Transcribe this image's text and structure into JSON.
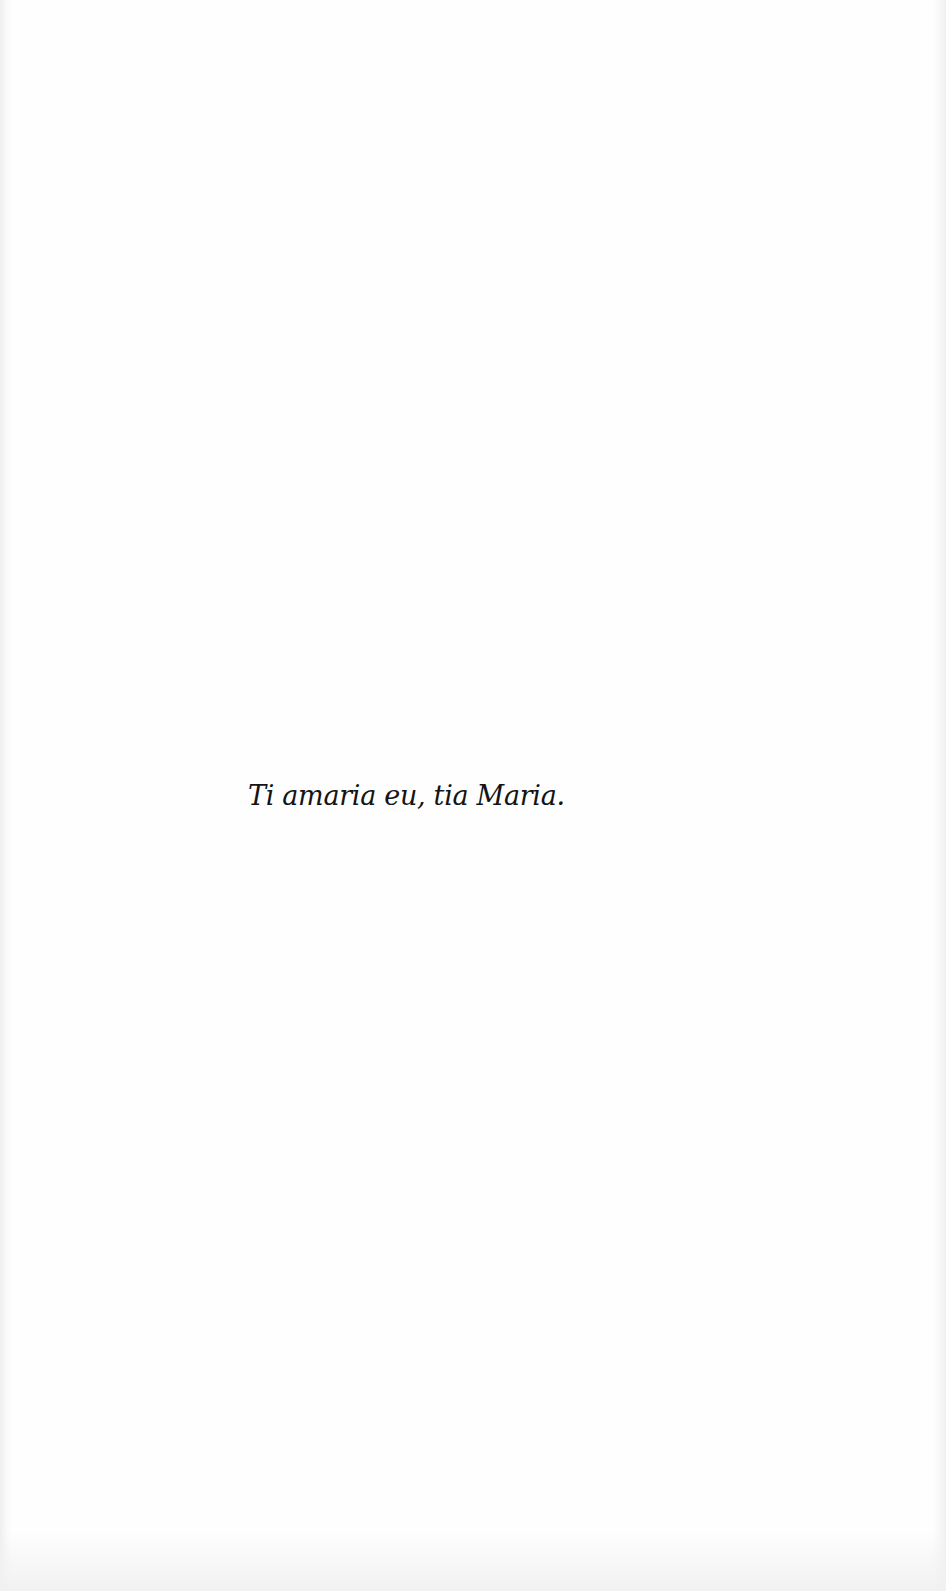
{
  "page": {
    "epigraph": "Ti amaria eu, tia Maria.",
    "text_color": "#141414",
    "background_color": "#fefefe"
  }
}
